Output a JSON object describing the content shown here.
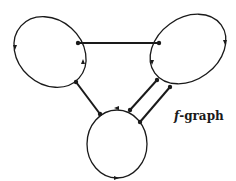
{
  "diagram": {
    "label": {
      "symbol": "f",
      "suffix": "-graph"
    },
    "stroke_color": "#1a1a1a",
    "background": "#ffffff",
    "nodes": [
      {
        "id": "loop-left",
        "shape": "ellipse",
        "cx": 50,
        "cy": 52,
        "rx": 39,
        "ry": 32,
        "rotate": 42
      },
      {
        "id": "loop-right",
        "shape": "ellipse",
        "cx": 188,
        "cy": 49,
        "rx": 41,
        "ry": 31,
        "rotate": -36
      },
      {
        "id": "loop-bottom",
        "shape": "ellipse",
        "cx": 117,
        "cy": 144,
        "rx": 30,
        "ry": 34,
        "rotate": 0
      }
    ],
    "edges": [
      {
        "id": "edge-left-right",
        "from": [
          78,
          43
        ],
        "to": [
          159,
          43
        ]
      },
      {
        "id": "edge-left-bottom",
        "from": [
          76,
          82
        ],
        "to": [
          100,
          114
        ]
      },
      {
        "id": "edge-right-bottom-1",
        "from": [
          157,
          80
        ],
        "to": [
          130,
          110
        ]
      },
      {
        "id": "edge-right-bottom-2",
        "from": [
          170,
          87
        ],
        "to": [
          140,
          122
        ]
      }
    ],
    "vertices": [
      [
        78,
        43
      ],
      [
        76,
        82
      ],
      [
        159,
        43
      ],
      [
        157,
        80
      ],
      [
        170,
        87
      ],
      [
        100,
        114
      ],
      [
        130,
        110
      ],
      [
        140,
        122
      ]
    ],
    "arrows": [
      {
        "at": [
          15,
          48
        ],
        "dir": "down"
      },
      {
        "at": [
          83,
          62
        ],
        "dir": "up"
      },
      {
        "at": [
          225,
          43
        ],
        "dir": "down"
      },
      {
        "at": [
          152,
          62
        ],
        "dir": "down"
      },
      {
        "at": [
          117,
          108
        ],
        "dir": "left"
      },
      {
        "at": [
          116,
          178
        ],
        "dir": "right"
      }
    ]
  }
}
